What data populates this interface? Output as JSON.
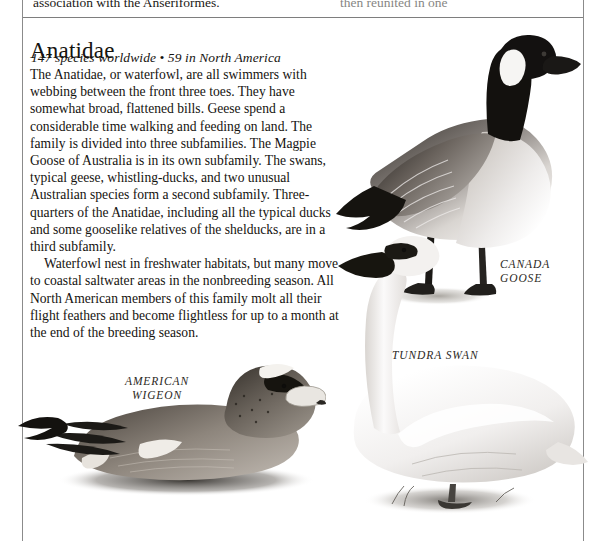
{
  "page": {
    "background_color": "#ffffff",
    "ink_color": "#15130f",
    "rule_color": "#8b8b8b"
  },
  "previous_column": {
    "left_fragment": "association with the Anseriformes.",
    "right_fragment": "then reunited in one"
  },
  "family": {
    "name": "Anatidae",
    "counts": "147 species worldwide • 59 in North America",
    "paragraphs": [
      "The Anatidae, or waterfowl, are all swimmers with webbing between the front three toes. They have somewhat broad, flattened bills. Geese spend a considerable time walking and feeding on land. The family is divided into three subfamilies. The Magpie Goose of Australia is in its own subfamily. The swans, typical geese, whistling-ducks, and two unusual Australian species form a second subfamily. Three-quarters of the Anatidae, including all the typical ducks and some gooselike relatives of the shelducks, are in a third subfamily.",
      "Waterfowl nest in freshwater habitats, but many move to coastal saltwater areas in the nonbreeding season. All North American members of this family molt all their flight feathers and become flightless for up to a month at the end of the breeding season."
    ]
  },
  "illustrations": [
    {
      "id": "canada-goose",
      "caption_line1": "CANADA",
      "caption_line2": "GOOSE",
      "caption": "CANADA GOOSE"
    },
    {
      "id": "tundra-swan",
      "caption_line1": "TUNDRA SWAN",
      "caption_line2": "",
      "caption": "TUNDRA SWAN"
    },
    {
      "id": "american-wigeon",
      "caption_line1": "AMERICAN",
      "caption_line2": "WIGEON",
      "caption": "AMERICAN WIGEON"
    }
  ]
}
